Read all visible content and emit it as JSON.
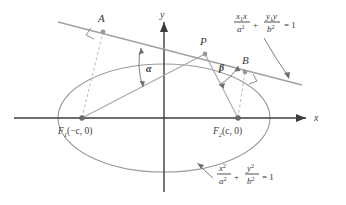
{
  "figure": {
    "type": "geometry-diagram",
    "background_color": "#ffffff",
    "axis_color": "#3c3c3c",
    "curve_color": "#9a9a9a",
    "line_color": "#a0a0a0",
    "dash_color": "#b0b0b0",
    "text_color": "#3a3a3a"
  },
  "axes": {
    "x_label": "x",
    "y_label": "y",
    "origin": {
      "x": 164,
      "y": 118
    }
  },
  "points": {
    "A": {
      "label": "A",
      "x": 103,
      "y": 32
    },
    "B": {
      "label": "B",
      "x": 245,
      "y": 72
    },
    "P": {
      "label": "P",
      "x": 205,
      "y": 54
    },
    "F1": {
      "label_main": "F",
      "label_sub": "1",
      "label_coords": "(−c, 0)",
      "x": 82,
      "y": 118
    },
    "F2": {
      "label_main": "F",
      "label_sub": "2",
      "label_coords": "(c, 0)",
      "x": 238,
      "y": 118
    }
  },
  "angles": {
    "alpha": {
      "label": "α",
      "x": 148,
      "y": 68
    },
    "beta": {
      "label": "β",
      "x": 222,
      "y": 70
    }
  },
  "equations": {
    "tangent": {
      "num1_x1": "x",
      "num1_sub": "1",
      "num1_x": "x",
      "den1": "a",
      "den1_sup": "2",
      "plus": "+",
      "num2_y1": "y",
      "num2_sub": "1",
      "num2_y": "y",
      "den2": "b",
      "den2_sup": "2",
      "equals": "= 1",
      "full_text": "x₁x/a² + y₁y/b² = 1"
    },
    "ellipse": {
      "num1": "x",
      "num1_sup": "2",
      "den1": "a",
      "den1_sup": "2",
      "plus": "+",
      "num2": "y",
      "num2_sup": "2",
      "den2": "b",
      "den2_sup": "2",
      "equals": "= 1",
      "full_text": "x²/a² + y²/b² = 1"
    }
  },
  "ellipse_geometry": {
    "center_x": 164,
    "center_y": 118,
    "semi_major_a": 106,
    "semi_minor_b": 54
  }
}
